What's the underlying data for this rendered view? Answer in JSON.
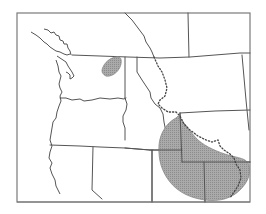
{
  "map": {
    "type": "range-map",
    "region": "Western North America (Pacific Northwest to Colorado Plateau)",
    "colors": {
      "background": "#ffffff",
      "frame": "#7a7a7a",
      "borders": "#555555",
      "range_fill": "#a8a8a8",
      "dotted_line": "#444444"
    },
    "features": {
      "range_north": "small shaded range patch in eastern Washington",
      "range_south": "large shaded range area covering Utah / Colorado / Arizona / New Mexico corner",
      "dotted_boundary": "dotted boundary line running from Idaho/Montana border south-east into Wyoming and down to New Mexico"
    }
  }
}
